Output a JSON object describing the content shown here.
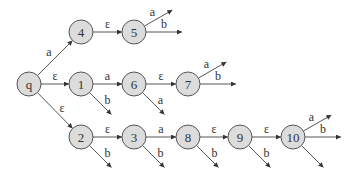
{
  "diagram": {
    "type": "automaton-state-tree",
    "node_radius": 12,
    "colors": {
      "node_fill": "#dcdcdc",
      "node_stroke": "#555555",
      "edge": "#444444",
      "text": "#333333"
    },
    "nodes": [
      {
        "id": "q",
        "label": "q",
        "x": 29,
        "y": 84
      },
      {
        "id": "4",
        "label": "4",
        "x": 81,
        "y": 32
      },
      {
        "id": "5",
        "label": "5",
        "x": 134,
        "y": 32
      },
      {
        "id": "1",
        "label": "1",
        "x": 81,
        "y": 84
      },
      {
        "id": "6",
        "label": "6",
        "x": 134,
        "y": 84
      },
      {
        "id": "7",
        "label": "7",
        "x": 188,
        "y": 84
      },
      {
        "id": "2",
        "label": "2",
        "x": 81,
        "y": 137
      },
      {
        "id": "3",
        "label": "3",
        "x": 134,
        "y": 137
      },
      {
        "id": "8",
        "label": "8",
        "x": 188,
        "y": 137
      },
      {
        "id": "9",
        "label": "9",
        "x": 240,
        "y": 137
      },
      {
        "id": "10",
        "label": "10",
        "x": 293,
        "y": 137
      }
    ],
    "edges": [
      {
        "from": "q",
        "to": "4",
        "label": "a"
      },
      {
        "from": "4",
        "to": "5",
        "label": "ε"
      },
      {
        "from": "5",
        "to": null,
        "label": "a",
        "dir": "up-right"
      },
      {
        "from": "5",
        "to": null,
        "label": "b",
        "dir": "right"
      },
      {
        "from": "q",
        "to": "1",
        "label": "ε"
      },
      {
        "from": "1",
        "to": "6",
        "label": "a"
      },
      {
        "from": "1",
        "to": null,
        "label": "b",
        "dir": "down-right"
      },
      {
        "from": "6",
        "to": "7",
        "label": "ε"
      },
      {
        "from": "6",
        "to": null,
        "label": "a",
        "dir": "down-right"
      },
      {
        "from": "7",
        "to": null,
        "label": "a",
        "dir": "up-right"
      },
      {
        "from": "7",
        "to": null,
        "label": "b",
        "dir": "right"
      },
      {
        "from": "q",
        "to": "2",
        "label": "ε"
      },
      {
        "from": "2",
        "to": "3",
        "label": "ε"
      },
      {
        "from": "2",
        "to": null,
        "label": "b",
        "dir": "down-right"
      },
      {
        "from": "3",
        "to": "8",
        "label": "a"
      },
      {
        "from": "3",
        "to": null,
        "label": "b",
        "dir": "down-right"
      },
      {
        "from": "8",
        "to": "9",
        "label": "ε"
      },
      {
        "from": "8",
        "to": null,
        "label": "b",
        "dir": "down-right"
      },
      {
        "from": "9",
        "to": "10",
        "label": "ε"
      },
      {
        "from": "9",
        "to": null,
        "label": "b",
        "dir": "down-right"
      },
      {
        "from": "10",
        "to": null,
        "label": "a",
        "dir": "up-right"
      },
      {
        "from": "10",
        "to": null,
        "label": "b",
        "dir": "right"
      },
      {
        "from": "10",
        "to": null,
        "label": "",
        "dir": "down-right"
      }
    ]
  }
}
